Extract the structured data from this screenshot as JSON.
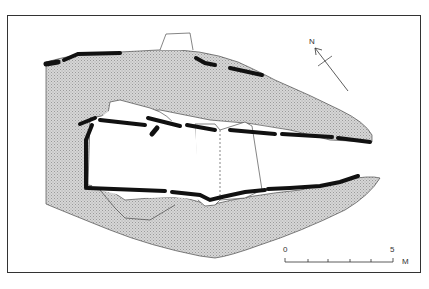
{
  "figure": {
    "type": "archaeological site plan",
    "north_arrow": {
      "label": "N"
    },
    "scale_bar": {
      "start_label": "0",
      "end_label": "5",
      "unit_label": "M",
      "ticks": 6
    },
    "colors": {
      "stipple": "#c8c8c8",
      "wall": "#111111",
      "outline": "#333333",
      "background": "#ffffff"
    }
  }
}
